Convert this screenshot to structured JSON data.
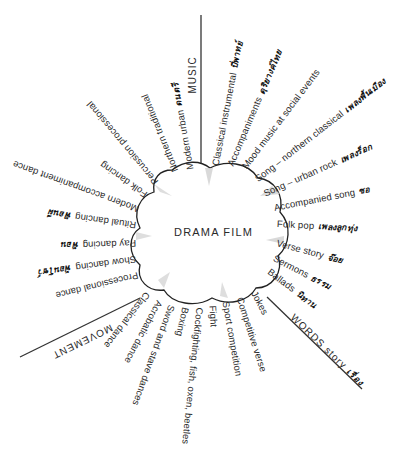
{
  "center": {
    "title": "DRAMA FILM"
  },
  "sections": {
    "music": {
      "label": "MUSIC"
    },
    "words": {
      "label": "WORDS story",
      "thai": "เรื่อง"
    },
    "movement": {
      "label": "MOVEMENT"
    }
  },
  "labels": {
    "music": [
      {
        "text": "Classical instrumental",
        "thai": "ปี่พาทย์"
      },
      {
        "text": "Accompaniments",
        "thai": "ดุริยางค์ไทย"
      },
      {
        "text": "Mood music at social events",
        "thai": ""
      },
      {
        "text": "Song – northern classical",
        "thai": "เพลงพื้นเมือง"
      },
      {
        "text": "Song – urban rock",
        "thai": "เพลงร็อก"
      },
      {
        "text": "Accompanied song",
        "thai": "ซอ"
      },
      {
        "text": "Folk pop",
        "thai": "เพลงลูกทุ่ง"
      },
      {
        "text": "Modern urban",
        "thai": "ดนตรี"
      },
      {
        "text": "Northern traditional",
        "thai": ""
      }
    ],
    "words": [
      {
        "text": "Verse story",
        "thai": "จ๊อย"
      },
      {
        "text": "Sermons",
        "thai": "ธรรม"
      },
      {
        "text": "Ballads",
        "thai": "นิทาน"
      },
      {
        "text": "Jokes",
        "thai": ""
      },
      {
        "text": "Competitive verse",
        "thai": ""
      },
      {
        "text": "Sport competition",
        "thai": ""
      },
      {
        "text": "Fight",
        "thai": ""
      }
    ],
    "movement": [
      {
        "text": "Cockfighting, fish, oxen, beetles",
        "thai": ""
      },
      {
        "text": "Boxing",
        "thai": ""
      },
      {
        "text": "Sword and stave dances",
        "thai": ""
      },
      {
        "text": "Acrobatic dance",
        "thai": ""
      },
      {
        "text": "Classical dance",
        "thai": ""
      },
      {
        "text": "Processional dance",
        "thai": ""
      },
      {
        "text": "Show dancing",
        "thai": "ฟ้อนโชว์"
      },
      {
        "text": "Pay dancing",
        "thai": "ฟ้อน"
      },
      {
        "text": "Ritual dancing",
        "thai": "ฟ้อนผี"
      },
      {
        "text": "Modern accompaniment dance",
        "thai": ""
      },
      {
        "text": "Folk dancing",
        "thai": ""
      },
      {
        "text": "Percussion processional",
        "thai": ""
      }
    ]
  }
}
